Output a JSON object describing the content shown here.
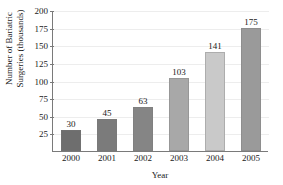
{
  "chart_data": {
    "type": "bar",
    "title": "",
    "xlabel": "Year",
    "ylabel": "Number of Bariatric Surgeries (thousands)",
    "ylabel_lines": [
      "Number of Bariatric",
      "Surgeries (thousands)"
    ],
    "categories": [
      "2000",
      "2001",
      "2002",
      "2003",
      "2004",
      "2005"
    ],
    "values": [
      30,
      45,
      63,
      103,
      141,
      175
    ],
    "value_labels": [
      "30",
      "45",
      "63",
      "103",
      "141",
      "175"
    ],
    "ylim": [
      0,
      200
    ],
    "yticks": [
      25,
      50,
      75,
      100,
      125,
      150,
      175,
      200
    ],
    "ytick_labels": [
      "25",
      "50",
      "75",
      "100",
      "125",
      "150",
      "175",
      "200"
    ],
    "grid": true,
    "legend": false,
    "bar_colors": [
      "#6e6e6e",
      "#7b7b7b",
      "#858585",
      "#a8a8a8",
      "#c9c9c9",
      "#9a9a9a"
    ]
  },
  "axes": {
    "x_title": "Year"
  }
}
